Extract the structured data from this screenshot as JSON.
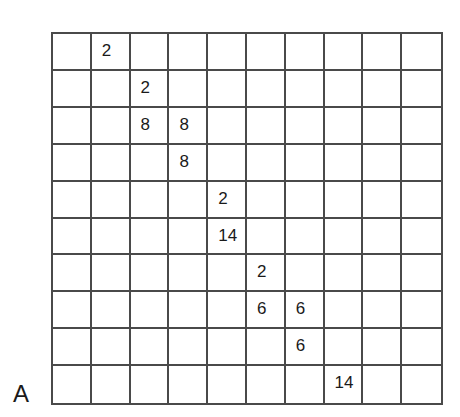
{
  "panel_label": "A",
  "grid": {
    "rows": 10,
    "cols": 10,
    "cells": [
      [
        "",
        "2",
        "",
        "",
        "",
        "",
        "",
        "",
        "",
        ""
      ],
      [
        "",
        "",
        "2",
        "",
        "",
        "",
        "",
        "",
        "",
        ""
      ],
      [
        "",
        "",
        "8",
        "8",
        "",
        "",
        "",
        "",
        "",
        ""
      ],
      [
        "",
        "",
        "",
        "8",
        "",
        "",
        "",
        "",
        "",
        ""
      ],
      [
        "",
        "",
        "",
        "",
        "2",
        "",
        "",
        "",
        "",
        ""
      ],
      [
        "",
        "",
        "",
        "",
        "14",
        "",
        "",
        "",
        "",
        ""
      ],
      [
        "",
        "",
        "",
        "",
        "",
        "2",
        "",
        "",
        "",
        ""
      ],
      [
        "",
        "",
        "",
        "",
        "",
        "6",
        "6",
        "",
        "",
        ""
      ],
      [
        "",
        "",
        "",
        "",
        "",
        "",
        "6",
        "",
        "",
        ""
      ],
      [
        "",
        "",
        "",
        "",
        "",
        "",
        "",
        "14",
        "",
        ""
      ]
    ]
  },
  "colors": {
    "line": "#4a4a4a",
    "text": "#1a1a1a",
    "background": "#ffffff"
  }
}
